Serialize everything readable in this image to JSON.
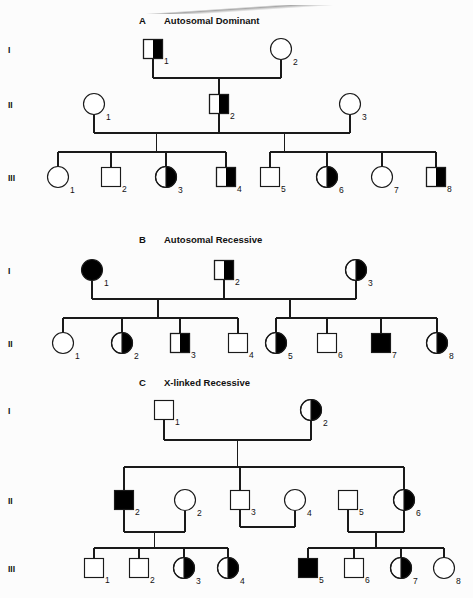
{
  "figure": {
    "type": "pedigree-chart",
    "width": 473,
    "height": 598,
    "background": "#fcfcfc",
    "stroke_color": "#1a1a1a",
    "fill_affected": "#000000",
    "fill_unaffected": "#ffffff"
  },
  "legend_semantics": {
    "square": "male",
    "circle": "female",
    "open": "unaffected",
    "filled": "affected",
    "half_filled": "carrier / heterozygote"
  },
  "panels": [
    {
      "id": "A",
      "letter": "A",
      "title": "Autosomal Dominant",
      "generation_labels": [
        "I",
        "II",
        "III"
      ],
      "individuals": [
        {
          "gen": "I",
          "label": "1",
          "shape": "square",
          "fill": "half",
          "cx": 153,
          "cy": 49
        },
        {
          "gen": "I",
          "label": "2",
          "shape": "circle",
          "fill": "open",
          "cx": 281,
          "cy": 49
        },
        {
          "gen": "II",
          "label": "1",
          "shape": "circle",
          "fill": "open",
          "cx": 94,
          "cy": 104
        },
        {
          "gen": "II",
          "label": "2",
          "shape": "square",
          "fill": "half",
          "cx": 219,
          "cy": 104
        },
        {
          "gen": "II",
          "label": "3",
          "shape": "circle",
          "fill": "open",
          "cx": 350,
          "cy": 104
        },
        {
          "gen": "III",
          "label": "1",
          "shape": "circle",
          "fill": "open",
          "cx": 58,
          "cy": 177
        },
        {
          "gen": "III",
          "label": "2",
          "shape": "square",
          "fill": "open",
          "cx": 111,
          "cy": 177
        },
        {
          "gen": "III",
          "label": "3",
          "shape": "circle",
          "fill": "half",
          "cx": 166,
          "cy": 177
        },
        {
          "gen": "III",
          "label": "4",
          "shape": "square",
          "fill": "half",
          "cx": 226,
          "cy": 177
        },
        {
          "gen": "III",
          "label": "5",
          "shape": "square",
          "fill": "open",
          "cx": 270,
          "cy": 177
        },
        {
          "gen": "III",
          "label": "6",
          "shape": "circle",
          "fill": "half",
          "cx": 327,
          "cy": 177
        },
        {
          "gen": "III",
          "label": "7",
          "shape": "circle",
          "fill": "open",
          "cx": 382,
          "cy": 177
        },
        {
          "gen": "III",
          "label": "8",
          "shape": "square",
          "fill": "half",
          "cx": 436,
          "cy": 177
        }
      ]
    },
    {
      "id": "B",
      "letter": "B",
      "title": "Autosomal Recessive",
      "generation_labels": [
        "I",
        "II"
      ],
      "individuals": [
        {
          "gen": "I",
          "label": "1",
          "shape": "circle",
          "fill": "full",
          "cx": 92,
          "cy": 270
        },
        {
          "gen": "I",
          "label": "2",
          "shape": "square",
          "fill": "half",
          "cx": 224,
          "cy": 270
        },
        {
          "gen": "I",
          "label": "3",
          "shape": "circle",
          "fill": "half",
          "cx": 356,
          "cy": 270
        },
        {
          "gen": "II",
          "label": "1",
          "shape": "circle",
          "fill": "open",
          "cx": 63,
          "cy": 343
        },
        {
          "gen": "II",
          "label": "2",
          "shape": "circle",
          "fill": "half",
          "cx": 122,
          "cy": 343
        },
        {
          "gen": "II",
          "label": "3",
          "shape": "square",
          "fill": "half",
          "cx": 180,
          "cy": 343
        },
        {
          "gen": "II",
          "label": "4",
          "shape": "square",
          "fill": "open",
          "cx": 238,
          "cy": 343
        },
        {
          "gen": "II",
          "label": "5",
          "shape": "circle",
          "fill": "half",
          "cx": 276,
          "cy": 343
        },
        {
          "gen": "II",
          "label": "6",
          "shape": "square",
          "fill": "open",
          "cx": 327,
          "cy": 343
        },
        {
          "gen": "II",
          "label": "7",
          "shape": "square",
          "fill": "full",
          "cx": 381,
          "cy": 343
        },
        {
          "gen": "II",
          "label": "8",
          "shape": "circle",
          "fill": "half",
          "cx": 437,
          "cy": 343
        }
      ]
    },
    {
      "id": "C",
      "letter": "C",
      "title": "X-linked Recessive",
      "generation_labels": [
        "I",
        "II",
        "III"
      ],
      "individuals": [
        {
          "gen": "I",
          "label": "1",
          "shape": "square",
          "fill": "open",
          "cx": 164,
          "cy": 410
        },
        {
          "gen": "I",
          "label": "2",
          "shape": "circle",
          "fill": "half",
          "cx": 311,
          "cy": 410
        },
        {
          "gen": "II",
          "label": "2",
          "shape": "square",
          "fill": "full",
          "cx": 124,
          "cy": 500
        },
        {
          "gen": "II",
          "label": "2",
          "shape": "circle",
          "fill": "open",
          "cx": 185,
          "cy": 500
        },
        {
          "gen": "II",
          "label": "3",
          "shape": "square",
          "fill": "open",
          "cx": 240,
          "cy": 500
        },
        {
          "gen": "II",
          "label": "4",
          "shape": "circle",
          "fill": "open",
          "cx": 295,
          "cy": 500
        },
        {
          "gen": "II",
          "label": "5",
          "shape": "square",
          "fill": "open",
          "cx": 348,
          "cy": 500
        },
        {
          "gen": "II",
          "label": "6",
          "shape": "circle",
          "fill": "half",
          "cx": 404,
          "cy": 500
        },
        {
          "gen": "III",
          "label": "1",
          "shape": "square",
          "fill": "open",
          "cx": 94,
          "cy": 568
        },
        {
          "gen": "III",
          "label": "2",
          "shape": "square",
          "fill": "open",
          "cx": 139,
          "cy": 568
        },
        {
          "gen": "III",
          "label": "3",
          "shape": "circle",
          "fill": "half",
          "cx": 184,
          "cy": 568
        },
        {
          "gen": "III",
          "label": "4",
          "shape": "circle",
          "fill": "half",
          "cx": 228,
          "cy": 568
        },
        {
          "gen": "III",
          "label": "5",
          "shape": "square",
          "fill": "full",
          "cx": 308,
          "cy": 568
        },
        {
          "gen": "III",
          "label": "6",
          "shape": "square",
          "fill": "open",
          "cx": 354,
          "cy": 568
        },
        {
          "gen": "III",
          "label": "7",
          "shape": "circle",
          "fill": "half",
          "cx": 401,
          "cy": 568
        },
        {
          "gen": "III",
          "label": "8",
          "shape": "circle",
          "fill": "open",
          "cx": 444,
          "cy": 568
        }
      ]
    }
  ]
}
